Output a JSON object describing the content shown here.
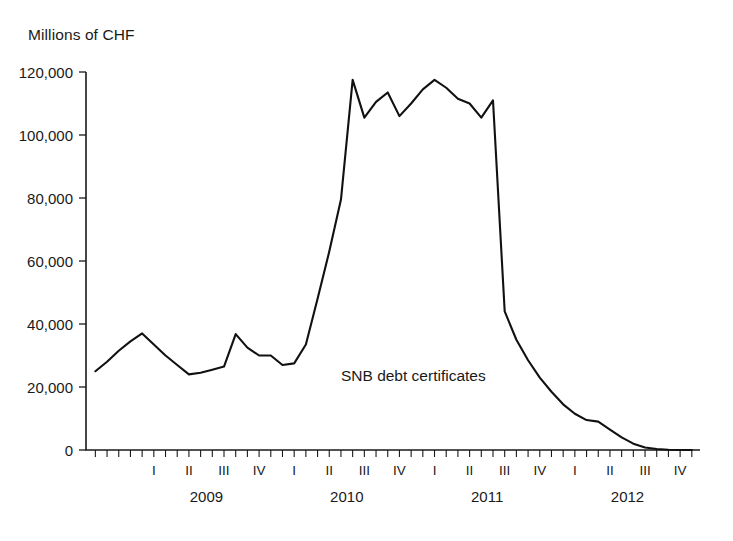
{
  "chart_data": {
    "type": "line",
    "title": "",
    "ylabel": "Millions of CHF",
    "xlabel": "",
    "ylim": [
      0,
      120000
    ],
    "yticks": [
      0,
      20000,
      40000,
      60000,
      80000,
      100000,
      120000
    ],
    "ytick_labels": [
      "0",
      "20,000",
      "40,000",
      "60,000",
      "80,000",
      "100,000",
      "120,000"
    ],
    "grid": false,
    "legend_position": "inline-annotation",
    "annotations": [
      {
        "text": "SNB debt certificates",
        "x_index": 21,
        "y_value": 22000
      }
    ],
    "series": [
      {
        "name": "SNB debt certificates",
        "color": "#111111",
        "values": [
          25000,
          28000,
          31500,
          34500,
          37000,
          33500,
          30000,
          27000,
          24000,
          24500,
          25500,
          26500,
          36800,
          32500,
          30000,
          30000,
          27000,
          27500,
          33500,
          48000,
          63000,
          79500,
          117500,
          105500,
          110500,
          113500,
          106000,
          110000,
          114500,
          117500,
          115000,
          111500,
          110000,
          105500,
          111000,
          44000,
          35000,
          28500,
          23000,
          18500,
          14500,
          11500,
          9500,
          9000,
          6500,
          4000,
          2000,
          800,
          300,
          100,
          0,
          0
        ]
      }
    ],
    "x_axis": {
      "minor_ticks_per_quarter": 3,
      "quarters": [
        "I",
        "II",
        "III",
        "IV"
      ],
      "years": [
        "2009",
        "2010",
        "2011",
        "2012"
      ],
      "lead_in_months": 4
    }
  }
}
